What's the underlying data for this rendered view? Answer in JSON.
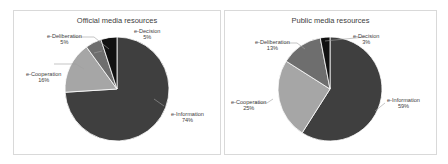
{
  "chart_data": [
    {
      "type": "pie",
      "title": "Official media resources",
      "categories": [
        "e-Information",
        "e-Cooperation",
        "e-Deliberation",
        "e-Decision"
      ],
      "values": [
        74,
        16,
        5,
        5
      ],
      "labels": [
        {
          "name": "e-Information",
          "pct": "74%"
        },
        {
          "name": "e-Cooperation",
          "pct": "16%"
        },
        {
          "name": "e-Deliberation",
          "pct": "5%"
        },
        {
          "name": "e-Decision",
          "pct": "5%"
        }
      ],
      "colors": [
        "#3f3f3f",
        "#a6a6a6",
        "#6e6e6e",
        "#111111"
      ],
      "legend": "none (data labels with leader lines)"
    },
    {
      "type": "pie",
      "title": "Public media resources",
      "categories": [
        "e-Information",
        "e-Cooperation",
        "e-Deliberation",
        "e-Decision"
      ],
      "values": [
        59,
        25,
        13,
        3
      ],
      "labels": [
        {
          "name": "e-Information",
          "pct": "59%"
        },
        {
          "name": "e-Cooperation",
          "pct": "25%"
        },
        {
          "name": "e-Deliberation",
          "pct": "13%"
        },
        {
          "name": "e-Decision",
          "pct": "3%"
        }
      ],
      "colors": [
        "#3f3f3f",
        "#a6a6a6",
        "#6e6e6e",
        "#111111"
      ],
      "legend": "none (data labels with leader lines)"
    }
  ]
}
